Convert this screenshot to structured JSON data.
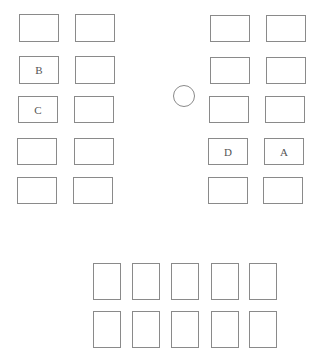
{
  "diagram": {
    "type": "seating-layout",
    "left_group": {
      "desks": [
        {
          "row": 1,
          "col": 1,
          "label": "",
          "x": 19,
          "y": 14,
          "w": 40,
          "h": 28
        },
        {
          "row": 1,
          "col": 2,
          "label": "",
          "x": 75,
          "y": 14,
          "w": 40,
          "h": 28
        },
        {
          "row": 2,
          "col": 1,
          "label": "B",
          "x": 19,
          "y": 56,
          "w": 40,
          "h": 28
        },
        {
          "row": 2,
          "col": 2,
          "label": "",
          "x": 75,
          "y": 56,
          "w": 40,
          "h": 28
        },
        {
          "row": 3,
          "col": 1,
          "label": "C",
          "x": 18,
          "y": 96,
          "w": 40,
          "h": 27
        },
        {
          "row": 3,
          "col": 2,
          "label": "",
          "x": 74,
          "y": 96,
          "w": 40,
          "h": 27
        },
        {
          "row": 4,
          "col": 1,
          "label": "",
          "x": 17,
          "y": 138,
          "w": 40,
          "h": 27
        },
        {
          "row": 4,
          "col": 2,
          "label": "",
          "x": 74,
          "y": 138,
          "w": 40,
          "h": 27
        },
        {
          "row": 5,
          "col": 1,
          "label": "",
          "x": 17,
          "y": 177,
          "w": 40,
          "h": 27
        },
        {
          "row": 5,
          "col": 2,
          "label": "",
          "x": 73,
          "y": 177,
          "w": 40,
          "h": 27
        }
      ]
    },
    "right_group": {
      "desks": [
        {
          "row": 1,
          "col": 1,
          "label": "",
          "x": 210,
          "y": 15,
          "w": 40,
          "h": 27
        },
        {
          "row": 1,
          "col": 2,
          "label": "",
          "x": 266,
          "y": 15,
          "w": 40,
          "h": 27
        },
        {
          "row": 2,
          "col": 1,
          "label": "",
          "x": 210,
          "y": 57,
          "w": 40,
          "h": 27
        },
        {
          "row": 2,
          "col": 2,
          "label": "",
          "x": 266,
          "y": 57,
          "w": 40,
          "h": 27
        },
        {
          "row": 3,
          "col": 1,
          "label": "",
          "x": 209,
          "y": 96,
          "w": 40,
          "h": 27
        },
        {
          "row": 3,
          "col": 2,
          "label": "",
          "x": 265,
          "y": 96,
          "w": 40,
          "h": 27
        },
        {
          "row": 4,
          "col": 1,
          "label": "D",
          "x": 208,
          "y": 138,
          "w": 40,
          "h": 27
        },
        {
          "row": 4,
          "col": 2,
          "label": "A",
          "x": 264,
          "y": 138,
          "w": 40,
          "h": 27
        },
        {
          "row": 5,
          "col": 1,
          "label": "",
          "x": 208,
          "y": 177,
          "w": 40,
          "h": 27
        },
        {
          "row": 5,
          "col": 2,
          "label": "",
          "x": 263,
          "y": 177,
          "w": 40,
          "h": 27
        }
      ]
    },
    "center_marker": {
      "shape": "circle",
      "cx": 184,
      "cy": 96,
      "r": 11
    },
    "bottom_group": {
      "desks": [
        {
          "row": 1,
          "col": 1,
          "label": "",
          "x": 93,
          "y": 263,
          "w": 28,
          "h": 37
        },
        {
          "row": 1,
          "col": 2,
          "label": "",
          "x": 132,
          "y": 263,
          "w": 28,
          "h": 37
        },
        {
          "row": 1,
          "col": 3,
          "label": "",
          "x": 171,
          "y": 263,
          "w": 28,
          "h": 37
        },
        {
          "row": 1,
          "col": 4,
          "label": "",
          "x": 211,
          "y": 263,
          "w": 28,
          "h": 37
        },
        {
          "row": 1,
          "col": 5,
          "label": "",
          "x": 249,
          "y": 263,
          "w": 28,
          "h": 37
        },
        {
          "row": 2,
          "col": 1,
          "label": "",
          "x": 93,
          "y": 311,
          "w": 28,
          "h": 37
        },
        {
          "row": 2,
          "col": 2,
          "label": "",
          "x": 132,
          "y": 311,
          "w": 28,
          "h": 37
        },
        {
          "row": 2,
          "col": 3,
          "label": "",
          "x": 171,
          "y": 311,
          "w": 28,
          "h": 37
        },
        {
          "row": 2,
          "col": 4,
          "label": "",
          "x": 211,
          "y": 311,
          "w": 28,
          "h": 37
        },
        {
          "row": 2,
          "col": 5,
          "label": "",
          "x": 249,
          "y": 311,
          "w": 28,
          "h": 37
        }
      ]
    },
    "colors": {
      "stroke": "#8a8a8a",
      "label": "#555555",
      "background": "#ffffff"
    }
  }
}
